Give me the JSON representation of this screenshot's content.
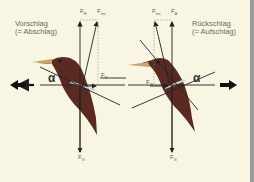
{
  "left_panel": {
    "caption_line1": "Vorschlag",
    "caption_line2": "(= Abschlag)",
    "labels": {
      "f_lift": {
        "main": "F",
        "sub": "H"
      },
      "f_resultant": {
        "main": "F",
        "sub": "res"
      },
      "f_drag": {
        "main": "F",
        "sub": "N"
      },
      "f_gravity": {
        "main": "F",
        "sub": "G"
      },
      "angle": "α"
    },
    "thrust_direction": "left"
  },
  "right_panel": {
    "caption_line1": "Rückschlag",
    "caption_line2": "(= Aufschlag)",
    "labels": {
      "f_resultant": {
        "main": "F",
        "sub": "res"
      },
      "f_lift": {
        "main": "F",
        "sub": "A"
      },
      "f_drag": {
        "main": "F",
        "sub": "W"
      },
      "f_gravity": {
        "main": "F",
        "sub": "G"
      },
      "angle": "α"
    },
    "thrust_direction": "right"
  },
  "colors": {
    "background": "#f8f5e3",
    "bird_body": "#5a2a22",
    "beak": "#c9a36a",
    "lines": "#222222"
  }
}
